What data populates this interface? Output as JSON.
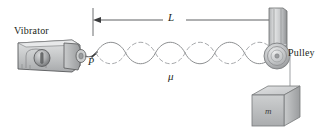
{
  "figure": {
    "background_color": "#ffffff",
    "width": 326,
    "height": 135
  },
  "labels": {
    "vibrator": "Vibrator",
    "pulley": "Pulley",
    "length": "L",
    "point": "P",
    "linear_density": "μ",
    "mass": "m"
  },
  "colors": {
    "ink": "#231f20",
    "line": "#58595b",
    "wave_solid": "#8d8f91",
    "wave_dashed": "#a7a9ac",
    "device_light": "#d9dadb",
    "device_mid": "#bcbec0",
    "device_dark": "#939598",
    "device_outline": "#58595b",
    "mass_top": "#d6d7d8",
    "mass_front": "#b4b6b8",
    "mass_side": "#9a9c9e",
    "string": "#a7a9ac"
  },
  "geometry": {
    "dimension_line": {
      "label": "L",
      "x_start": 93,
      "x_end": 277,
      "y": 20,
      "arrowheads": "both"
    },
    "string_axis_y": 53,
    "standing_wave": {
      "loops": 6,
      "x_start": 96,
      "x_end": 274,
      "amplitude": 11,
      "envelope": "solid-and-dashed"
    },
    "pulley": {
      "center_x": 277,
      "center_y": 56,
      "outer_radius": 13
    },
    "hanging_mass": {
      "x": 249,
      "y": 88,
      "width": 40,
      "height": 38
    }
  },
  "icons": {
    "vibrator_dial": "dial-icon",
    "arrow_left": "arrow-left-icon",
    "arrow_right": "arrow-right-icon"
  }
}
